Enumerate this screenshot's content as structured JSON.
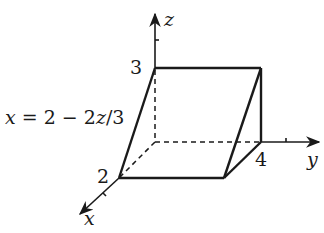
{
  "diagram": {
    "type": "3d-solid-region",
    "axes": {
      "x": {
        "label": "x"
      },
      "y": {
        "label": "y"
      },
      "z": {
        "label": "z"
      }
    },
    "tick_labels": {
      "x_intercept": "2",
      "y_intercept": "4",
      "z_intercept": "3"
    },
    "surface_label": {
      "lhs": "x",
      "eq": " = 2 − 2",
      "z": "z",
      "tail": "/3"
    },
    "colors": {
      "stroke": "#1a1a1a",
      "background": "#ffffff"
    }
  }
}
